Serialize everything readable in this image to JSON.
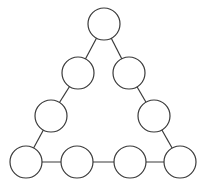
{
  "diagram": {
    "type": "magic-triangle-puzzle",
    "colors": {
      "background": "#ffffff",
      "stroke": "#3a3a3a",
      "node_fill": "#ffffff"
    },
    "node_radius": 16,
    "nodes": [
      {
        "id": "top",
        "cx": 104,
        "cy": 24,
        "label": ""
      },
      {
        "id": "left-upper",
        "cx": 78,
        "cy": 73,
        "label": ""
      },
      {
        "id": "right-upper",
        "cx": 129,
        "cy": 73,
        "label": ""
      },
      {
        "id": "left-lower",
        "cx": 51,
        "cy": 116,
        "label": ""
      },
      {
        "id": "right-lower",
        "cx": 154,
        "cy": 116,
        "label": ""
      },
      {
        "id": "bottom-left",
        "cx": 26,
        "cy": 162,
        "label": ""
      },
      {
        "id": "bottom-mid-left",
        "cx": 77,
        "cy": 162,
        "label": ""
      },
      {
        "id": "bottom-mid-right",
        "cx": 130,
        "cy": 162,
        "label": ""
      },
      {
        "id": "bottom-right",
        "cx": 180,
        "cy": 162,
        "label": ""
      }
    ],
    "edges": [
      [
        "top",
        "left-upper"
      ],
      [
        "left-upper",
        "left-lower"
      ],
      [
        "left-lower",
        "bottom-left"
      ],
      [
        "top",
        "right-upper"
      ],
      [
        "right-upper",
        "right-lower"
      ],
      [
        "right-lower",
        "bottom-right"
      ],
      [
        "bottom-left",
        "bottom-mid-left"
      ],
      [
        "bottom-mid-left",
        "bottom-mid-right"
      ],
      [
        "bottom-mid-right",
        "bottom-right"
      ]
    ]
  }
}
